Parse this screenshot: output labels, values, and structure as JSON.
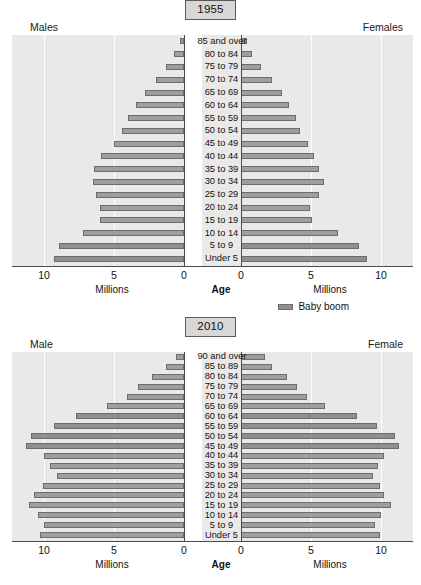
{
  "legend": {
    "label": "Baby boom",
    "swatch_color": "#8f8f8f"
  },
  "axis_caption": {
    "millions": "Millions",
    "age": "Age"
  },
  "ticks": {
    "t10": "10",
    "t5": "5",
    "t0": "0"
  },
  "charts": [
    {
      "title": "1955",
      "left_label": "Males",
      "right_label": "Females",
      "xlabel": "Millions",
      "center_label": "Age",
      "xlim": [
        0,
        12
      ],
      "xticks": [
        0,
        5,
        10
      ],
      "chart_data": {
        "type": "bar",
        "subtype": "population-pyramid",
        "title": "1955",
        "xlabel": "Millions",
        "ylabel": "Age",
        "xlim": [
          0,
          12
        ],
        "xticks": [
          0,
          5,
          10
        ],
        "grid": true,
        "legend": "Baby boom",
        "legend_position": "below-right",
        "categories": [
          "Under 5",
          "5 to 9",
          "10 to 14",
          "15 to 19",
          "20 to 24",
          "25 to 29",
          "30 to 34",
          "35 to 39",
          "40 to 44",
          "45 to 49",
          "50 to 54",
          "55 to 59",
          "60 to 64",
          "65 to 69",
          "70 to 74",
          "75 to 79",
          "80 to 84",
          "85 and over"
        ],
        "series": [
          {
            "name": "Males",
            "side": "left",
            "values": [
              9.3,
              8.9,
              7.2,
              6.0,
              6.0,
              6.3,
              6.5,
              6.4,
              5.9,
              5.0,
              4.4,
              4.0,
              3.4,
              2.8,
              2.0,
              1.3,
              0.7,
              0.3
            ]
          },
          {
            "name": "Females",
            "side": "right",
            "values": [
              9.0,
              8.4,
              6.9,
              5.1,
              4.9,
              5.6,
              5.9,
              5.6,
              5.2,
              4.8,
              4.2,
              3.9,
              3.4,
              2.9,
              2.2,
              1.4,
              0.8,
              0.4
            ]
          }
        ],
        "baby_boom_categories": [
          "Under 5",
          "5 to 9"
        ]
      }
    },
    {
      "title": "2010",
      "left_label": "Male",
      "right_label": "Female",
      "xlabel": "Millions",
      "center_label": "Age",
      "xlim": [
        0,
        12
      ],
      "xticks": [
        0,
        5,
        10
      ],
      "chart_data": {
        "type": "bar",
        "subtype": "population-pyramid",
        "title": "2010",
        "xlabel": "Millions",
        "ylabel": "Age",
        "xlim": [
          0,
          12
        ],
        "xticks": [
          0,
          5,
          10
        ],
        "grid": true,
        "legend": "Baby boom",
        "categories": [
          "Under 5",
          "5 to 9",
          "10 to 14",
          "15 to 19",
          "20 to 24",
          "25 to 29",
          "30 to 34",
          "35 to 39",
          "40 to 44",
          "45 to 49",
          "50 to 54",
          "55 to 59",
          "60 to 64",
          "65 to 69",
          "70 to 74",
          "75 to 79",
          "80 to 84",
          "85 to 89",
          "90 and over"
        ],
        "series": [
          {
            "name": "Male",
            "side": "left",
            "values": [
              10.3,
              10.0,
              10.4,
              11.1,
              10.7,
              10.1,
              9.1,
              9.6,
              10.0,
              11.3,
              10.9,
              9.3,
              7.7,
              5.5,
              4.1,
              3.3,
              2.3,
              1.3,
              0.6
            ]
          },
          {
            "name": "Female",
            "side": "right",
            "values": [
              9.9,
              9.6,
              10.0,
              10.7,
              10.2,
              9.9,
              9.4,
              9.8,
              10.2,
              11.3,
              11.0,
              9.7,
              8.3,
              6.0,
              4.7,
              4.0,
              3.3,
              2.2,
              1.7
            ]
          }
        ],
        "baby_boom_categories": [
          "45 to 49",
          "50 to 54",
          "55 to 59",
          "60 to 64"
        ]
      }
    }
  ]
}
